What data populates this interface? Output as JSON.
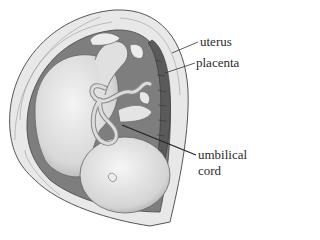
{
  "diagram": {
    "labels": [
      {
        "id": "uterus",
        "text": "uterus"
      },
      {
        "id": "placenta",
        "text": "placenta"
      },
      {
        "id": "umbilical-cord",
        "line1": "umbilical",
        "line2": "cord"
      }
    ]
  }
}
